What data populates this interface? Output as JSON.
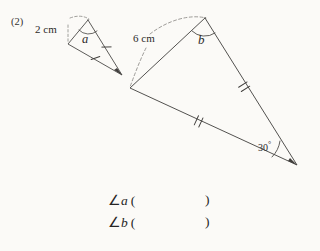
{
  "page": {
    "background": "#fbfaf7",
    "ink": "#3a3837",
    "question_number": "(2)"
  },
  "figures": {
    "small_triangle": {
      "name": "small-triangle",
      "side_label": "2 cm",
      "angle_label": "a",
      "tick_count": 1,
      "vertices": {
        "apex": [
          88,
          20
        ],
        "left": [
          68,
          44
        ],
        "tip": [
          122,
          75
        ]
      },
      "dashed_leader": true
    },
    "large_triangle": {
      "name": "large-triangle",
      "side_label": "6 cm",
      "angle_label": "b",
      "angle_value": "30",
      "degree_symbol": "°",
      "tick_count": 2,
      "vertices": {
        "apex": [
          205,
          18
        ],
        "left": [
          130,
          88
        ],
        "right": [
          297,
          165
        ]
      },
      "dashed_leader": true
    }
  },
  "answers": {
    "rows": [
      {
        "angle_symbol": "∠",
        "variable": "a",
        "open_paren": "(",
        "close_paren": ")",
        "value": ""
      },
      {
        "angle_symbol": "∠",
        "variable": "b",
        "open_paren": "(",
        "close_paren": ")",
        "value": ""
      }
    ]
  }
}
